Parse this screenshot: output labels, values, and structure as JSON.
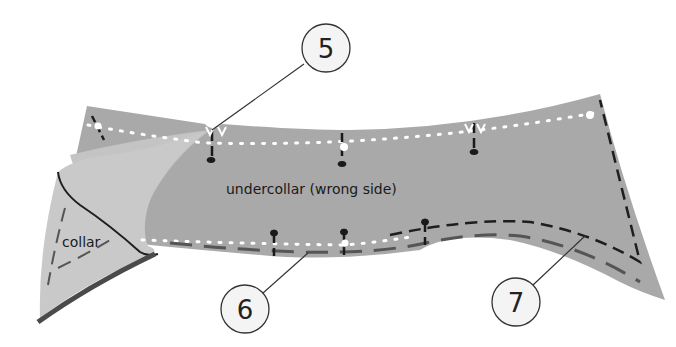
{
  "diagram": {
    "labels": {
      "undercollar": "undercollar (wrong side)",
      "collar": "collar"
    },
    "callouts": [
      {
        "number": "5",
        "cx": 326,
        "cy": 48,
        "r": 24,
        "leader": [
          304,
          64,
          212,
          130
        ]
      },
      {
        "number": "6",
        "cx": 245,
        "cy": 309,
        "r": 24,
        "leader": [
          263,
          293,
          308,
          253
        ]
      },
      {
        "number": "7",
        "cx": 516,
        "cy": 302,
        "r": 24,
        "leader": [
          533,
          285,
          585,
          236
        ]
      }
    ],
    "colors": {
      "background": "#ffffff",
      "undercollar_fill": "#a9a9a9",
      "collar_fill": "#c9c9c9",
      "collar_edge": "#4a4a4a",
      "stitch_dark": "#1e1e1e",
      "stitch_gray": "#555555",
      "thread_white": "#ffffff",
      "callout_fill": "#f4f4f4",
      "callout_stroke": "#333333"
    }
  }
}
